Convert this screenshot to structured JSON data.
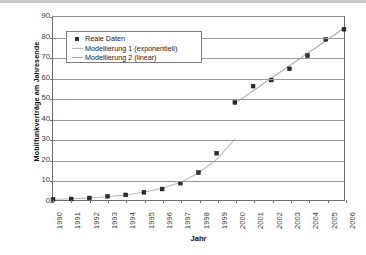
{
  "chart_data": {
    "type": "scatter",
    "title": "",
    "xlabel": "Jahr",
    "ylabel": "Mobilfunkverträge am Jahresende",
    "xlim": [
      1990,
      2006
    ],
    "ylim": [
      0,
      90
    ],
    "ytick_step": 10,
    "grid": true,
    "legend_position": "upper-left-inside",
    "categories": [
      "1990",
      "1991",
      "1992",
      "1993",
      "1994",
      "1995",
      "1996",
      "1997",
      "1998",
      "1999",
      "2000",
      "2001",
      "2002",
      "2003",
      "2004",
      "2005",
      "2006"
    ],
    "yticks": [
      "0",
      "10",
      "20",
      "30",
      "40",
      "50",
      "60",
      "70",
      "80",
      "90"
    ],
    "series": [
      {
        "name": "Reale Daten",
        "style": "markers",
        "marker": "square",
        "color": "#2e2e2e",
        "x": [
          1990,
          1991,
          1992,
          1993,
          1994,
          1995,
          1996,
          1997,
          1998,
          1999,
          2000,
          2001,
          2002,
          2003,
          2004,
          2005,
          2006
        ],
        "values": [
          0.3,
          0.5,
          1.0,
          1.8,
          2.5,
          3.8,
          5.4,
          8.3,
          13.5,
          23.0,
          48.0,
          56.0,
          59.0,
          64.5,
          71.0,
          79.0,
          84.0
        ]
      },
      {
        "name": "Modellierung 1 (exponentiell)",
        "style": "line",
        "color": "#b9b9b9",
        "x": [
          1990,
          1991,
          1992,
          1993,
          1994,
          1995,
          1996,
          1997,
          1998,
          1999,
          2000
        ],
        "values": [
          0.35,
          0.6,
          1.0,
          1.6,
          2.5,
          3.8,
          5.8,
          8.6,
          13.3,
          20.0,
          30.0
        ]
      },
      {
        "name": "Modellierung 2 (linear)",
        "style": "line",
        "color": "#a8a8a8",
        "x": [
          2000,
          2006
        ],
        "values": [
          47.5,
          84.5
        ]
      }
    ],
    "legend": [
      {
        "label": "Reale Daten",
        "swatch": "square-marker"
      },
      {
        "label": "Modellierung 1 (exponentiell)",
        "swatch": "line"
      },
      {
        "label": "Modellierung 2 (linear)",
        "swatch": "line"
      }
    ]
  }
}
